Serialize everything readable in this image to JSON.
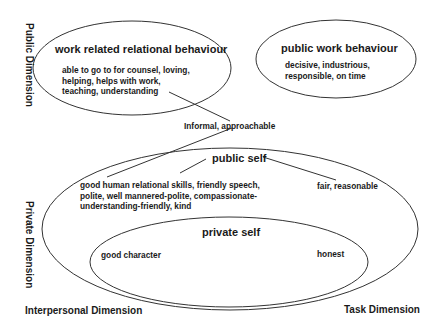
{
  "axes": {
    "public_dimension": "Public Dimension",
    "private_dimension": "Private Dimension",
    "interpersonal_dimension": "Interpersonal Dimension",
    "task_dimension": "Task Dimension"
  },
  "nodes": {
    "work_related": {
      "title": "work related relational behaviour",
      "lines": [
        "able to go to for counsel, loving,",
        "helping, helps with work,",
        "teaching, understanding"
      ]
    },
    "public_work": {
      "title": "public work behaviour",
      "lines": [
        "decisive, industrious,",
        "responsible, on time"
      ]
    },
    "connector_label": "Informal, approachable",
    "public_self": {
      "title": "public self",
      "left_lines": [
        "good human relational skills, friendly speech,",
        "polite, well mannered-polite, compassionate-",
        "understanding-friendly, kind"
      ],
      "right_label": "fair, reasonable"
    },
    "private_self": {
      "title": "private self",
      "left_label": "good character",
      "right_label": "honest"
    }
  },
  "colors": {
    "stroke": "#333333",
    "text": "#1a1a1a",
    "background": "#ffffff"
  }
}
